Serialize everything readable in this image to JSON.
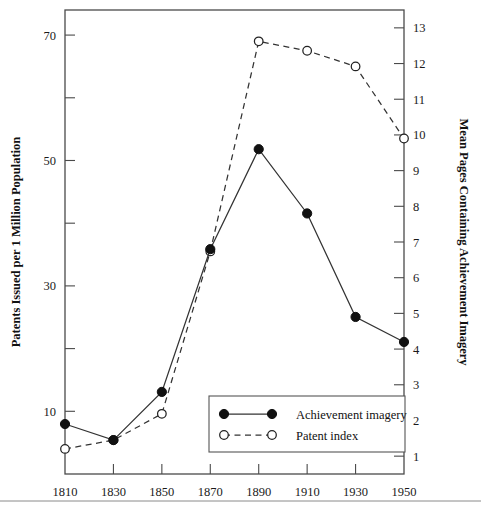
{
  "chart_data": {
    "type": "line",
    "title": "",
    "xlabel": "",
    "ylabel": "Patents Issued per 1 Million Population",
    "y2label": "Mean Pages Containing Achievement Imagery",
    "x": [
      1810,
      1830,
      1850,
      1870,
      1890,
      1910,
      1930,
      1950
    ],
    "xticklabels": [
      "1810",
      "1830",
      "1850",
      "1870",
      "1890",
      "1910",
      "1930",
      "1950"
    ],
    "yticklabels": [
      "10",
      "30",
      "50",
      "70"
    ],
    "yticks": [
      10,
      30,
      50,
      70
    ],
    "yminorticks": [
      20,
      40,
      60
    ],
    "ylim": [
      0,
      74
    ],
    "y2ticklabels": [
      "1",
      "2",
      "3",
      "4",
      "5",
      "6",
      "7",
      "8",
      "9",
      "10",
      "11",
      "12",
      "13"
    ],
    "y2ticks": [
      1,
      2,
      3,
      4,
      5,
      6,
      7,
      8,
      9,
      10,
      11,
      12,
      13
    ],
    "y2lim": [
      0.5,
      13.5
    ],
    "grid": false,
    "legend_position": "inside-lower-center",
    "series": [
      {
        "name": "Achievement imagery",
        "axis": "right",
        "marker": "filled-circle",
        "linestyle": "solid",
        "values": [
          1.9,
          1.45,
          2.8,
          6.8,
          9.6,
          7.8,
          4.9,
          4.2
        ]
      },
      {
        "name": "Patent index",
        "axis": "left",
        "marker": "open-circle",
        "linestyle": "dashed",
        "values": [
          4.0,
          5.4,
          9.6,
          35.5,
          69.0,
          67.5,
          65.0,
          53.5
        ]
      }
    ],
    "legend": [
      {
        "label": "Achievement imagery",
        "marker": "filled-circle",
        "linestyle": "solid"
      },
      {
        "label": "Patent index",
        "marker": "open-circle",
        "linestyle": "dashed"
      }
    ]
  },
  "colors": {
    "line": "#333333",
    "frame": "#4a4a4a",
    "text": "#111111",
    "marker_fill": "#111111",
    "marker_open_fill": "#ffffff"
  }
}
